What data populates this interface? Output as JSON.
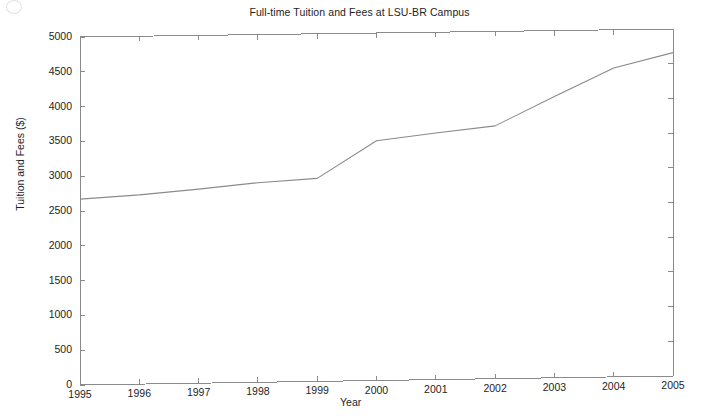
{
  "figure": {
    "title": "Full-time Tuition and Fees at LSU-BR Campus",
    "background_color": "#ffffff",
    "axis_color": "#8a8a8a",
    "line_color": "#8a8a8a",
    "text_color": "#1e1e1e"
  },
  "chart_data": {
    "type": "line",
    "title": "Full-time Tuition and Fees at LSU-BR Campus",
    "xlabel": "Year",
    "ylabel": "Tuition and Fees ($)",
    "x": [
      1995,
      1996,
      1997,
      1998,
      1999,
      2000,
      2001,
      2002,
      2003,
      2004,
      2005
    ],
    "values": [
      2670,
      2720,
      2790,
      2870,
      2920,
      3450,
      3550,
      3640,
      4050,
      4450,
      4660
    ],
    "series": [
      {
        "name": "Full-time Tuition and Fees",
        "values": [
          2670,
          2720,
          2790,
          2870,
          2920,
          3450,
          3550,
          3640,
          4050,
          4450,
          4660
        ]
      }
    ],
    "xlim": [
      1995,
      2005
    ],
    "ylim": [
      0,
      5000
    ],
    "xticks": [
      1995,
      1996,
      1997,
      1998,
      1999,
      2000,
      2001,
      2002,
      2003,
      2004,
      2005
    ],
    "yticks": [
      0,
      500,
      1000,
      1500,
      2000,
      2500,
      3000,
      3500,
      4000,
      4500,
      5000
    ],
    "xtick_labels": [
      "1995",
      "1996",
      "1997",
      "1998",
      "1999",
      "2000",
      "2001",
      "2002",
      "2003",
      "2004",
      "2005"
    ],
    "ytick_labels": [
      "0",
      "500",
      "1000",
      "1500",
      "2000",
      "2500",
      "3000",
      "3500",
      "4000",
      "4500",
      "5000"
    ],
    "grid": false,
    "legend": null,
    "legend_position": "none",
    "annotations": []
  }
}
